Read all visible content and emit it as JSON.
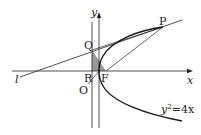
{
  "diagram": {
    "type": "geometry-figure",
    "curve_equation": "y²=4x",
    "labels": {
      "y_axis": "y",
      "x_axis": "x",
      "origin": "O",
      "focus": "F",
      "point_P": "P",
      "point_Q": "Q",
      "point_R": "R",
      "line_l": "l",
      "equation_lhs": "y",
      "equation_exp": "2",
      "equation_rhs": "=4x"
    },
    "colors": {
      "stroke": "#222222",
      "curve": "#1a1a1a",
      "shade": "#9a9a9a",
      "background": "#ffffff"
    }
  }
}
